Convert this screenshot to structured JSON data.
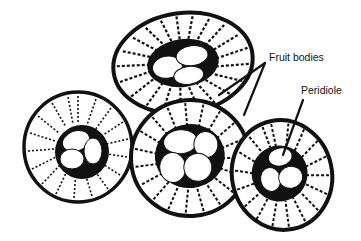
{
  "diagram": {
    "labels": {
      "fruit_bodies": "Fruit bodies",
      "peridiole": "Peridiole"
    },
    "colors": {
      "ink": "#111111",
      "paper": "#ffffff"
    },
    "fruit_bodies": [
      {
        "id": "top",
        "cx": 183,
        "cy": 63,
        "rx": 70,
        "ry": 52,
        "rot": -8,
        "peridioles": 3
      },
      {
        "id": "left",
        "cx": 78,
        "cy": 147,
        "rx": 54,
        "ry": 56,
        "rot": 0,
        "peridioles": 3
      },
      {
        "id": "center",
        "cx": 190,
        "cy": 158,
        "rx": 60,
        "ry": 58,
        "rot": -5,
        "peridioles": 4
      },
      {
        "id": "right",
        "cx": 282,
        "cy": 175,
        "rx": 50,
        "ry": 56,
        "rot": -10,
        "peridioles": 3
      }
    ]
  }
}
